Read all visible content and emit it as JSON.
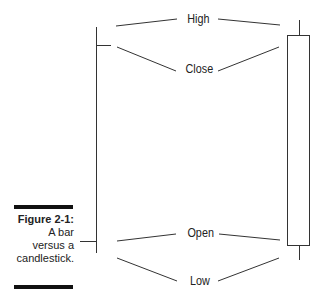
{
  "figure": {
    "number_label": "Figure 2-1:",
    "caption_lines": [
      "A bar",
      "versus a",
      "candlestick."
    ]
  },
  "labels": {
    "high": "High",
    "close": "Close",
    "open": "Open",
    "low": "Low"
  },
  "colors": {
    "line": "#333333",
    "rule": "#111111",
    "text": "#222222"
  }
}
